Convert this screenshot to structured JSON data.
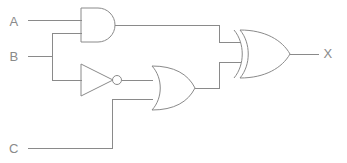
{
  "diagram": {
    "line_color": "#8a8a8a",
    "background_color": "#ffffff",
    "label_color": "#8a8a8a"
  },
  "inputs": [
    {
      "id": "A",
      "label": "A",
      "x": 14,
      "y": 26
    },
    {
      "id": "B",
      "label": "B",
      "x": 14,
      "y": 56
    },
    {
      "id": "C",
      "label": "C",
      "x": 14,
      "y": 150
    }
  ],
  "outputs": [
    {
      "id": "X",
      "label": "X",
      "x": 326,
      "y": 52
    }
  ],
  "gates": [
    {
      "id": "and1",
      "type": "AND",
      "label": "AND",
      "inputs": [
        "A",
        "B"
      ],
      "output": "and1_out"
    },
    {
      "id": "not1",
      "type": "NOT",
      "label": "NOT",
      "inputs": [
        "B"
      ],
      "output": "not1_out"
    },
    {
      "id": "or1",
      "type": "OR",
      "label": "OR",
      "inputs": [
        "not1_out",
        "C"
      ],
      "output": "or1_out"
    },
    {
      "id": "xor1",
      "type": "XOR",
      "label": "XOR",
      "inputs": [
        "and1_out",
        "or1_out"
      ],
      "output": "X"
    }
  ],
  "expression": "X = (A AND B) XOR ((NOT B) OR C)"
}
